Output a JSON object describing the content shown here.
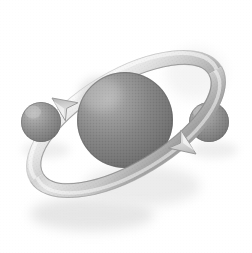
{
  "image": {
    "title": "Atom orbit illustration",
    "subject": "atom-with-orbiting-electrons",
    "style": "grayscale airbrushed clip-art with halftone dither texture",
    "width": 252,
    "height": 253,
    "background_color": "#ffffff"
  },
  "palette": {
    "background": "#ffffff",
    "sphere_highlight": "#b9b9b9",
    "sphere_midtone": "#8e8e8e",
    "sphere_core": "#757575",
    "sphere_shadow": "#5e5e5e",
    "sphere_rim": "#6a6a6a",
    "ribbon_light": "#f2f2f2",
    "ribbon_mid": "#c9c9c9",
    "ribbon_dark": "#9a9a9a",
    "ribbon_edge": "#8b8b8b",
    "drop_shadow": "#cfcfcf",
    "soft_shadow": "#e3e3e3"
  },
  "elements": {
    "nucleus": {
      "name": "central sphere",
      "center_x": 125,
      "center_y": 120,
      "radius": 48,
      "highlight_x": 100,
      "highlight_y": 94
    },
    "electron_left": {
      "name": "left small sphere",
      "center_x": 41,
      "center_y": 122,
      "radius": 20,
      "highlight_x": 33,
      "highlight_y": 112
    },
    "electron_right": {
      "name": "right small sphere",
      "center_x": 209,
      "center_y": 122,
      "radius": 20,
      "highlight_x": 201,
      "highlight_y": 112
    },
    "orbit_ribbon": {
      "name": "tilted elliptical orbit band",
      "center_x": 126,
      "center_y": 124,
      "radius_x": 104,
      "radius_y": 46,
      "rotation_degrees": -31,
      "band_width": 15
    },
    "arrow_top_left": {
      "name": "upper-left direction arrowhead",
      "tip_x": 52,
      "tip_y": 98,
      "direction": "down-left",
      "angle_degrees": 215
    },
    "arrow_bottom_right": {
      "name": "lower-right direction arrowhead",
      "tip_x": 196,
      "tip_y": 154,
      "direction": "down-right",
      "angle_degrees": 35
    }
  },
  "labels": {
    "alt_text": "Grayscale illustration of an atom: a large shaded sphere encircled by a tilted orbit ribbon with two directional arrows, flanked by two smaller spheres.",
    "nucleus_label": "nucleus",
    "electron_left_label": "electron",
    "electron_right_label": "electron",
    "orbit_label": "orbit path"
  }
}
